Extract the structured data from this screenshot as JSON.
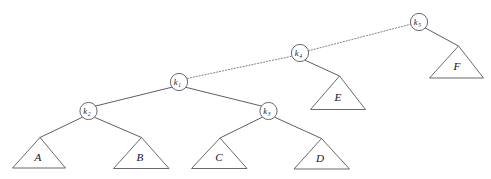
{
  "figure": {
    "background_color": "#ffffff",
    "line_color": "#58585f",
    "text_color": "#1b1b1f",
    "width": 491,
    "height": 179
  },
  "nodes": [
    {
      "id": "k1",
      "key_letter": "k",
      "subscript": "1",
      "cx": 179.0,
      "cy": 82.0,
      "r": 8.6
    },
    {
      "id": "k2",
      "key_letter": "k",
      "subscript": "2",
      "cx": 88.5,
      "cy": 111.0,
      "r": 8.6
    },
    {
      "id": "k3",
      "key_letter": "k",
      "subscript": "3",
      "cx": 268.5,
      "cy": 111.0,
      "r": 8.6
    },
    {
      "id": "k4",
      "key_letter": "k",
      "subscript": "4",
      "cx": 300.0,
      "cy": 53.0,
      "r": 8.6
    },
    {
      "id": "k5",
      "key_letter": "k",
      "subscript": "5",
      "cx": 419.0,
      "cy": 22.0,
      "r": 8.6
    }
  ],
  "subtrees": [
    {
      "id": "A",
      "label": "A",
      "apex_x": 40.0,
      "apex_y": 137.5,
      "base_left_x": 12.5,
      "base_right_x": 65.5,
      "base_y": 168.0,
      "label_x": 38.0,
      "label_y": 160.5
    },
    {
      "id": "B",
      "label": "B",
      "apex_x": 141.5,
      "apex_y": 137.5,
      "base_left_x": 113.5,
      "base_right_x": 169.0,
      "base_y": 168.5,
      "label_x": 140.0,
      "label_y": 160.5
    },
    {
      "id": "C",
      "label": "C",
      "apex_x": 220.0,
      "apex_y": 138.0,
      "base_left_x": 191.5,
      "base_right_x": 247.0,
      "base_y": 168.5,
      "label_x": 219.0,
      "label_y": 161.0
    },
    {
      "id": "D",
      "label": "D",
      "apex_x": 321.5,
      "apex_y": 138.5,
      "base_left_x": 294.0,
      "base_right_x": 349.5,
      "base_y": 169.0,
      "label_x": 320.0,
      "label_y": 161.5
    },
    {
      "id": "E",
      "label": "E",
      "apex_x": 339.5,
      "apex_y": 76.0,
      "base_left_x": 310.5,
      "base_right_x": 365.5,
      "base_y": 109.5,
      "label_x": 338.0,
      "label_y": 101.0
    },
    {
      "id": "F",
      "label": "F",
      "apex_x": 458.5,
      "apex_y": 46.0,
      "base_left_x": 429.5,
      "base_right_x": 483.5,
      "base_y": 78.0,
      "label_x": 457.0,
      "label_y": 69.5
    }
  ],
  "edges": [
    {
      "id": "k1-k2",
      "from": "k1",
      "to": "k2",
      "x1": 172.0,
      "y1": 87.2,
      "x2": 95.6,
      "y2": 106.0,
      "style": "solid"
    },
    {
      "id": "k1-k3",
      "from": "k1",
      "to": "k3",
      "x1": 186.2,
      "y1": 87.4,
      "x2": 261.4,
      "y2": 106.0,
      "style": "solid"
    },
    {
      "id": "k1-k4",
      "from": "k1",
      "to": "k4",
      "x1": 187.3,
      "y1": 78.4,
      "x2": 292.0,
      "y2": 56.2,
      "style": "dotted"
    },
    {
      "id": "k4-k5",
      "from": "k4",
      "to": "k5",
      "x1": 308.4,
      "y1": 50.8,
      "x2": 410.7,
      "y2": 24.2,
      "style": "dotted"
    },
    {
      "id": "k2-A",
      "from": "k2",
      "to": "A",
      "x1": 82.5,
      "y1": 117.2,
      "x2": 40.0,
      "y2": 137.5,
      "style": "solid"
    },
    {
      "id": "k2-B",
      "from": "k2",
      "to": "B",
      "x1": 94.8,
      "y1": 117.4,
      "x2": 141.5,
      "y2": 137.5,
      "style": "solid"
    },
    {
      "id": "k3-C",
      "from": "k3",
      "to": "C",
      "x1": 262.3,
      "y1": 117.2,
      "x2": 220.0,
      "y2": 138.0,
      "style": "solid"
    },
    {
      "id": "k3-D",
      "from": "k3",
      "to": "D",
      "x1": 274.8,
      "y1": 117.3,
      "x2": 321.5,
      "y2": 138.5,
      "style": "solid"
    },
    {
      "id": "k4-E",
      "from": "k4",
      "to": "E",
      "x1": 305.0,
      "y1": 60.2,
      "x2": 339.5,
      "y2": 76.0,
      "style": "solid"
    },
    {
      "id": "k5-F",
      "from": "k5",
      "to": "F",
      "x1": 425.3,
      "y1": 28.0,
      "x2": 458.5,
      "y2": 46.0,
      "style": "solid"
    }
  ]
}
